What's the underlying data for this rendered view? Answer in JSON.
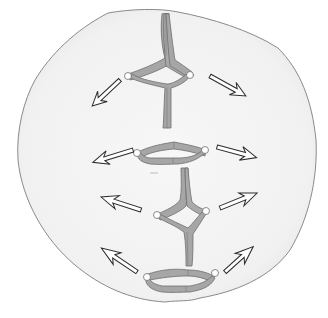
{
  "figure": {
    "title": "",
    "description": "Cell in anaphase with chromosomes separating; arrows indicate movement toward poles"
  },
  "colors": {
    "background": "#ffffff",
    "cell_fill": "#f2f2f2",
    "cell_outline": "#8a8a8a",
    "chromosome_fill": "#a6a6a6",
    "chromosome_outline": "#6e6e6e",
    "centromere_fill": "#ffffff",
    "arrow_fill": "#ffffff",
    "arrow_outline": "#2a2a2a"
  },
  "elements": {
    "cell": {
      "label": "cell"
    },
    "chromosomes": [
      {
        "id": "chromosome-1",
        "label": "chromosome"
      },
      {
        "id": "chromosome-2",
        "label": "chromosome"
      },
      {
        "id": "chromosome-3",
        "label": "chromosome"
      },
      {
        "id": "chromosome-4",
        "label": "chromosome"
      }
    ],
    "arrows": [
      {
        "id": "arrow-upper-left",
        "direction": "down-left"
      },
      {
        "id": "arrow-upper-right",
        "direction": "down-right"
      },
      {
        "id": "arrow-mid-left-1",
        "direction": "left"
      },
      {
        "id": "arrow-mid-right-1",
        "direction": "right"
      },
      {
        "id": "arrow-mid-left-2",
        "direction": "left"
      },
      {
        "id": "arrow-mid-right-2",
        "direction": "up-right"
      },
      {
        "id": "arrow-lower-left",
        "direction": "up-left"
      },
      {
        "id": "arrow-lower-right",
        "direction": "up-right"
      }
    ]
  }
}
